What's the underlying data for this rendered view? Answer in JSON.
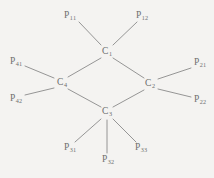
{
  "figure": {
    "background_color": "#f4f3f1",
    "line_color": "#8a8a8a",
    "text_color": "#6f6f6f"
  },
  "diagram": {
    "type": "node-link-graph",
    "nodes": [
      {
        "id": "C1",
        "base": "C",
        "sub": "1",
        "x": 107,
        "y": 52,
        "role": "carbon-center"
      },
      {
        "id": "C2",
        "base": "C",
        "sub": "2",
        "x": 150,
        "y": 84,
        "role": "carbon-center"
      },
      {
        "id": "C3",
        "base": "C",
        "sub": "3",
        "x": 107,
        "y": 112,
        "role": "carbon-center"
      },
      {
        "id": "C4",
        "base": "C",
        "sub": "4",
        "x": 62,
        "y": 83,
        "role": "carbon-center"
      }
    ],
    "terminals": [
      {
        "id": "P11",
        "base": "P",
        "sub": "11",
        "x": 70,
        "y": 16,
        "attach": "C1",
        "line": {
          "x1": 79,
          "y1": 22,
          "x2": 101,
          "y2": 45
        }
      },
      {
        "id": "P12",
        "base": "P",
        "sub": "12",
        "x": 142,
        "y": 16,
        "attach": "C1",
        "line": {
          "x1": 137,
          "y1": 22,
          "x2": 113,
          "y2": 45
        }
      },
      {
        "id": "P21",
        "base": "P",
        "sub": "21",
        "x": 200,
        "y": 63,
        "attach": "C2",
        "line": {
          "x1": 191,
          "y1": 68,
          "x2": 158,
          "y2": 79
        }
      },
      {
        "id": "P22",
        "base": "P",
        "sub": "22",
        "x": 200,
        "y": 100,
        "attach": "C2",
        "line": {
          "x1": 191,
          "y1": 97,
          "x2": 158,
          "y2": 89
        }
      },
      {
        "id": "P31",
        "base": "P",
        "sub": "31",
        "x": 70,
        "y": 148,
        "attach": "C3",
        "line": {
          "x1": 75,
          "y1": 142,
          "x2": 101,
          "y2": 119
        }
      },
      {
        "id": "P32",
        "base": "P",
        "sub": "32",
        "x": 108,
        "y": 160,
        "attach": "C3",
        "line": {
          "x1": 107,
          "y1": 153,
          "x2": 107,
          "y2": 120
        }
      },
      {
        "id": "P33",
        "base": "P",
        "sub": "33",
        "x": 141,
        "y": 148,
        "attach": "C3",
        "line": {
          "x1": 136,
          "y1": 142,
          "x2": 113,
          "y2": 119
        }
      },
      {
        "id": "P41",
        "base": "P",
        "sub": "41",
        "x": 16,
        "y": 62,
        "attach": "C4",
        "line": {
          "x1": 25,
          "y1": 66,
          "x2": 54,
          "y2": 78
        }
      },
      {
        "id": "P42",
        "base": "P",
        "sub": "42",
        "x": 16,
        "y": 99,
        "attach": "C4",
        "line": {
          "x1": 25,
          "y1": 95,
          "x2": 54,
          "y2": 88
        }
      }
    ],
    "edges": [
      {
        "from": "C1",
        "to": "C2",
        "x1": 113,
        "y1": 58,
        "x2": 144,
        "y2": 78
      },
      {
        "from": "C2",
        "to": "C3",
        "x1": 144,
        "y1": 90,
        "x2": 113,
        "y2": 107
      },
      {
        "from": "C3",
        "to": "C4",
        "x1": 101,
        "y1": 107,
        "x2": 68,
        "y2": 89
      },
      {
        "from": "C4",
        "to": "C1",
        "x1": 68,
        "y1": 77,
        "x2": 101,
        "y2": 58
      }
    ]
  }
}
